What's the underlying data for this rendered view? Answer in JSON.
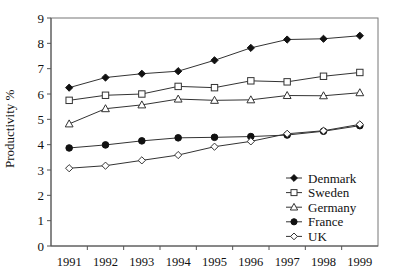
{
  "chart_data": {
    "type": "line",
    "title": "",
    "xlabel": "",
    "ylabel": "Productivity %",
    "categories": [
      "1991",
      "1992",
      "1993",
      "1994",
      "1995",
      "1996",
      "1997",
      "1998",
      "1999"
    ],
    "x": [
      1991,
      1992,
      1993,
      1994,
      1995,
      1996,
      1997,
      1998,
      1999
    ],
    "ylim": [
      0,
      9
    ],
    "yticks": [
      "0",
      "1",
      "2",
      "3",
      "4",
      "5",
      "6",
      "7",
      "8",
      "9"
    ],
    "grid": false,
    "legend_position": "bottom-right",
    "series": [
      {
        "name": "Denmark",
        "marker": "filled-diamond",
        "values": [
          6.25,
          6.65,
          6.8,
          6.9,
          7.33,
          7.82,
          8.15,
          8.18,
          8.3
        ]
      },
      {
        "name": "Sweden",
        "marker": "open-square",
        "values": [
          5.75,
          5.95,
          6.0,
          6.3,
          6.25,
          6.52,
          6.48,
          6.7,
          6.85
        ]
      },
      {
        "name": "Germany",
        "marker": "open-triangle",
        "values": [
          4.82,
          5.42,
          5.57,
          5.8,
          5.75,
          5.77,
          5.94,
          5.93,
          6.05
        ]
      },
      {
        "name": "France",
        "marker": "filled-circle",
        "values": [
          3.87,
          3.99,
          4.15,
          4.27,
          4.29,
          4.32,
          4.38,
          4.53,
          4.75
        ]
      },
      {
        "name": "UK",
        "marker": "open-diamond",
        "values": [
          3.07,
          3.17,
          3.38,
          3.59,
          3.92,
          4.13,
          4.43,
          4.55,
          4.8
        ]
      }
    ]
  },
  "legend": {
    "items": [
      {
        "label": "Denmark",
        "marker": "filled-diamond"
      },
      {
        "label": "Sweden",
        "marker": "open-square"
      },
      {
        "label": "Germany",
        "marker": "open-triangle"
      },
      {
        "label": "France",
        "marker": "filled-circle"
      },
      {
        "label": "UK",
        "marker": "open-diamond"
      }
    ]
  }
}
